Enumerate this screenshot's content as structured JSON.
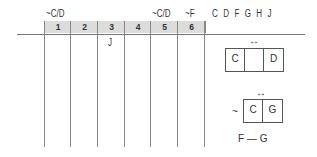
{
  "top_labels": {
    "c1": "~C/D",
    "c5": "~C/D",
    "c6": "~F"
  },
  "columns": [
    "1",
    "2",
    "3",
    "4",
    "5",
    "6"
  ],
  "row_mark": "J",
  "letters": "C D F G H J",
  "box1": {
    "arrow": "↔",
    "cells": [
      "C",
      "",
      "D"
    ]
  },
  "box2": {
    "prefix": "~",
    "arrow": "↔",
    "cells": [
      "C",
      "G"
    ]
  },
  "bottom_rule": "F — G"
}
